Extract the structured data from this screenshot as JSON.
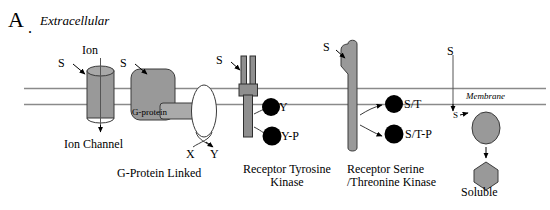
{
  "figure": {
    "panel_letter": "A",
    "panel_dot": ".",
    "type": "diagram",
    "colors": {
      "receptor_gray": "#999999",
      "outline": "#333333",
      "black": "#000000",
      "membrane_line": "#888888",
      "background": "#ffffff"
    }
  },
  "labels": {
    "extracellular": "Extracellular",
    "membrane": "Membrane",
    "ion": "Ion",
    "g_protein": "G-protein",
    "x": "X",
    "y": "Y",
    "signal_1": "S",
    "signal_2": "S",
    "signal_3": "S",
    "signal_4": "S",
    "signal_5": "S",
    "signal_6": "S",
    "tyrosine": "Y",
    "tyrosine_phos": "Y-P",
    "ser_thr": "S/T",
    "ser_thr_phos": "S/T-P"
  },
  "captions": {
    "ion_channel": "Ion Channel",
    "g_protein_linked": "G-Protein Linked",
    "receptor_tyrosine_kinase": "Receptor Tyrosine Kinase",
    "receptor_serine_threonine_kinase": "Receptor Serine /Threonine Kinase",
    "receptor_tyrosine_kinase_line1": "Receptor Tyrosine",
    "receptor_tyrosine_kinase_line2": "Kinase",
    "receptor_serine_threonine_kinase_line1": "Receptor Serine",
    "receptor_serine_threonine_kinase_line2": "/Threonine Kinase",
    "soluble": "Soluble"
  },
  "receptors": [
    {
      "name": "ion-channel",
      "caption": "Ion Channel",
      "ligand": "S",
      "shape": "cylinder"
    },
    {
      "name": "g-protein-linked",
      "caption": "G-Protein Linked",
      "ligand": "S",
      "shape": "rounded-rect",
      "effector": "G-protein",
      "outputs": [
        "X",
        "Y"
      ]
    },
    {
      "name": "receptor-tyrosine-kinase",
      "caption": "Receptor Tyrosine Kinase",
      "ligand": "S",
      "shape": "dimer-bars",
      "substrates": [
        "Y",
        "Y-P"
      ]
    },
    {
      "name": "receptor-serine-threonine-kinase",
      "caption": "Receptor Serine /Threonine Kinase",
      "ligand": "S",
      "shape": "hooked-bar",
      "substrates": [
        "S/T",
        "S/T-P"
      ]
    },
    {
      "name": "soluble-receptor",
      "caption": "Soluble",
      "ligand": "S",
      "shape": "oval-to-hexagon"
    }
  ]
}
